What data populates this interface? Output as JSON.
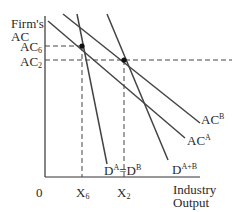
{
  "diagram": {
    "y_axis_label_line1": "Firm's",
    "y_axis_label_line2": "AC",
    "y_tick_ac6_main": "AC",
    "y_tick_ac6_sub": "6",
    "y_tick_ac2_main": "AC",
    "y_tick_ac2_sub": "2",
    "origin": "0",
    "x_tick_x6_main": "X",
    "x_tick_x6_sub": "6",
    "x_tick_x2_main": "X",
    "x_tick_x2_sub": "2",
    "x_axis_label_line1": "Industry",
    "x_axis_label_line2": "Output",
    "curve_acb_main": "AC",
    "curve_acb_sup": "B",
    "curve_aca_main": "AC",
    "curve_aca_sup": "A",
    "curve_dab_main": "D",
    "curve_dab_sup1": "A",
    "curve_dab_eq": "=D",
    "curve_dab_sup2": "B",
    "curve_dapb_main": "D",
    "curve_dapb_sup": "A+B"
  }
}
